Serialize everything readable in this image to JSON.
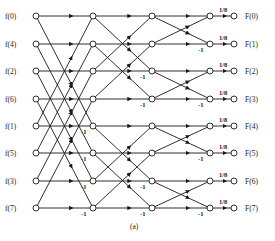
{
  "diagram": {
    "caption": "(a)",
    "inputs": [
      "f(0)",
      "f(4)",
      "f(2)",
      "f(6)",
      "f(1)",
      "f(5)",
      "f(3)",
      "f(7)"
    ],
    "outputs": [
      "F(0)",
      "F(1)",
      "F(2)",
      "F(3)",
      "F(4)",
      "F(5)",
      "F(6)",
      "F(7)"
    ],
    "scale_label": "1/8",
    "negation_label": "-1",
    "rows_y": [
      16,
      44,
      71,
      99,
      126,
      153,
      181,
      208
    ],
    "columns_x": [
      36,
      93,
      152,
      210,
      234
    ],
    "colors": {
      "line": "#1a1a1a",
      "background": "#ffffff"
    }
  }
}
